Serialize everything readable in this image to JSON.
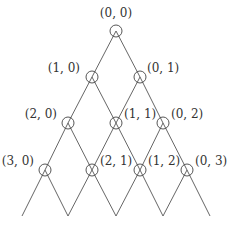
{
  "diagram": {
    "type": "lattice-tree",
    "nodes": [
      {
        "label": "(0, 0)",
        "x": 116,
        "y": 31,
        "lx": 116,
        "ly": 17,
        "anchor": "middle"
      },
      {
        "label": "(1, 0)",
        "x": 92,
        "y": 77,
        "lx": 80,
        "ly": 72,
        "anchor": "end"
      },
      {
        "label": "(0, 1)",
        "x": 140,
        "y": 77,
        "lx": 147,
        "ly": 72,
        "anchor": "start"
      },
      {
        "label": "(2, 0)",
        "x": 68,
        "y": 123,
        "lx": 57,
        "ly": 118,
        "anchor": "end"
      },
      {
        "label": "(1, 1)",
        "x": 116,
        "y": 123,
        "lx": 124,
        "ly": 118,
        "anchor": "start"
      },
      {
        "label": "(0, 2)",
        "x": 163,
        "y": 123,
        "lx": 171,
        "ly": 118,
        "anchor": "start"
      },
      {
        "label": "(3, 0)",
        "x": 45,
        "y": 170,
        "lx": 34,
        "ly": 165,
        "anchor": "end"
      },
      {
        "label": "(2, 1)",
        "x": 92,
        "y": 170,
        "lx": 100,
        "ly": 165,
        "anchor": "start"
      },
      {
        "label": "(1, 2)",
        "x": 140,
        "y": 170,
        "lx": 148,
        "ly": 165,
        "anchor": "start"
      },
      {
        "label": "(0, 3)",
        "x": 187,
        "y": 170,
        "lx": 195,
        "ly": 165,
        "anchor": "start"
      }
    ],
    "edges": [
      [
        116,
        31,
        92,
        77
      ],
      [
        116,
        31,
        140,
        77
      ],
      [
        92,
        77,
        68,
        123
      ],
      [
        92,
        77,
        116,
        123
      ],
      [
        140,
        77,
        116,
        123
      ],
      [
        140,
        77,
        163,
        123
      ],
      [
        68,
        123,
        45,
        170
      ],
      [
        68,
        123,
        92,
        170
      ],
      [
        116,
        123,
        92,
        170
      ],
      [
        116,
        123,
        140,
        170
      ],
      [
        163,
        123,
        140,
        170
      ],
      [
        163,
        123,
        187,
        170
      ],
      [
        45,
        170,
        22,
        216
      ],
      [
        45,
        170,
        68,
        216
      ],
      [
        92,
        170,
        68,
        216
      ],
      [
        92,
        170,
        116,
        216
      ],
      [
        140,
        170,
        116,
        216
      ],
      [
        140,
        170,
        163,
        216
      ],
      [
        187,
        170,
        163,
        216
      ],
      [
        187,
        170,
        210,
        216
      ]
    ],
    "node_radius": 6,
    "colors": {
      "line": "#555555",
      "text": "#333333",
      "background": "#ffffff"
    }
  }
}
